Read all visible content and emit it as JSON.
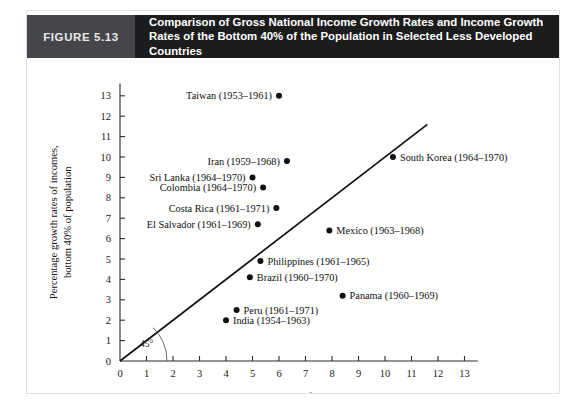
{
  "figure": {
    "number_label": "FIGURE 5.13",
    "title_line1": "Comparison of Gross National Income Growth Rates and Income Growth Rates of",
    "title_line2": "the Bottom 40% of the Population in Selected Less Developed Countries",
    "header_bg": "#1c1c1c",
    "number_block_bg": "#45454a"
  },
  "chart_data": {
    "type": "scatter",
    "title": "Comparison of Gross National Income Growth Rates and Income Growth Rates of the Bottom 40% of the Population in Selected Less Developed Countries",
    "xlabel": "Percentage growth rate of gross national income",
    "ylabel_line1": "Percentage growth rates of incomes,",
    "ylabel_line2": "bottom 40% of population",
    "xlim": [
      0,
      13.5
    ],
    "ylim": [
      0,
      13.6
    ],
    "xticks": [
      "0",
      "1",
      "2",
      "3",
      "4",
      "5",
      "6",
      "7",
      "8",
      "9",
      "10",
      "11",
      "12",
      "13"
    ],
    "yticks": [
      "0",
      "1",
      "2",
      "3",
      "4",
      "5",
      "6",
      "7",
      "8",
      "9",
      "10",
      "11",
      "12",
      "13"
    ],
    "grid": false,
    "legend": "none",
    "reference_line": {
      "label": "45°",
      "slope": 1,
      "intercept": 0,
      "x_start": 0,
      "x_end": 11.6
    },
    "points": [
      {
        "label": "Taiwan (1953–1961)",
        "x": 6.0,
        "y": 13.0,
        "label_side": "left"
      },
      {
        "label": "Iran (1959–1968)",
        "x": 6.3,
        "y": 9.8,
        "label_side": "left"
      },
      {
        "label": "South Korea (1964–1970)",
        "x": 10.3,
        "y": 10.0,
        "label_side": "right"
      },
      {
        "label": "Sri Lanka (1964–1970)",
        "x": 5.0,
        "y": 9.0,
        "label_side": "left"
      },
      {
        "label": "Colombia (1964–1970)",
        "x": 5.4,
        "y": 8.5,
        "label_side": "left"
      },
      {
        "label": "Costa Rica (1961–1971)",
        "x": 5.9,
        "y": 7.5,
        "label_side": "left"
      },
      {
        "label": "El Salvador (1961–1969)",
        "x": 5.2,
        "y": 6.7,
        "label_side": "left"
      },
      {
        "label": "Mexico (1963–1968)",
        "x": 7.9,
        "y": 6.4,
        "label_side": "right"
      },
      {
        "label": "Philippines (1961–1965)",
        "x": 5.3,
        "y": 4.9,
        "label_side": "right"
      },
      {
        "label": "Brazil (1960–1970)",
        "x": 4.9,
        "y": 4.1,
        "label_side": "right"
      },
      {
        "label": "Panama (1960–1969)",
        "x": 8.4,
        "y": 3.2,
        "label_side": "right"
      },
      {
        "label": "Peru (1961–1971)",
        "x": 4.4,
        "y": 2.5,
        "label_side": "right"
      },
      {
        "label": "India (1954–1963)",
        "x": 4.0,
        "y": 2.0,
        "label_side": "right"
      }
    ]
  }
}
